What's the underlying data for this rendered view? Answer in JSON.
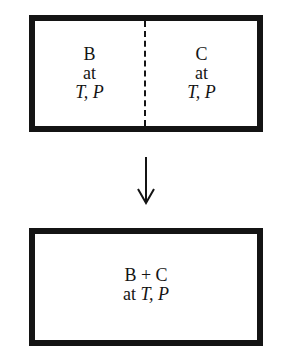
{
  "diagram": {
    "top_box": {
      "left": {
        "species": "B",
        "at": "at",
        "conditions": "T, P"
      },
      "right": {
        "species": "C",
        "at": "at",
        "conditions": "T, P"
      },
      "divider": "dashed partition"
    },
    "arrow": {
      "direction": "down"
    },
    "bottom_box": {
      "species": "B + C",
      "at": "at",
      "conditions": "T, P"
    }
  }
}
